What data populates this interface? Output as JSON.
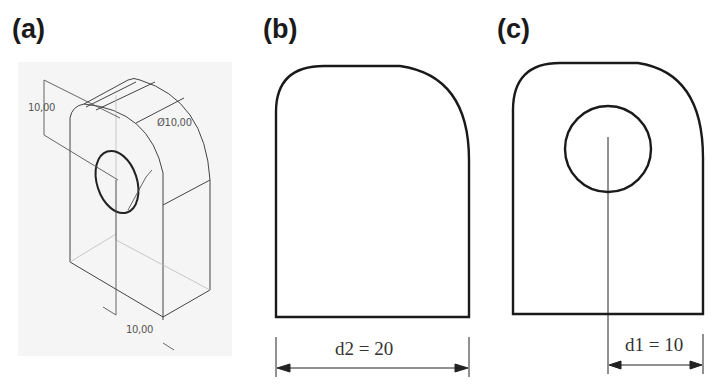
{
  "figure": {
    "panels": [
      {
        "id": "a",
        "label": "(a)",
        "type": "isometric-cad-view",
        "annotations": {
          "height_dim": "10,00",
          "hole_diameter": "Ø10,00",
          "bottom_dim": "10,00"
        }
      },
      {
        "id": "b",
        "label": "(b)",
        "type": "2d-profile",
        "dimension": "d2 = 20"
      },
      {
        "id": "c",
        "label": "(c)",
        "type": "2d-profile-with-hole",
        "dimension": "d1 = 10"
      }
    ],
    "colors": {
      "line": "#1a1a1a",
      "thin_line": "#555555",
      "iso_background": "#f5f5f5"
    }
  }
}
